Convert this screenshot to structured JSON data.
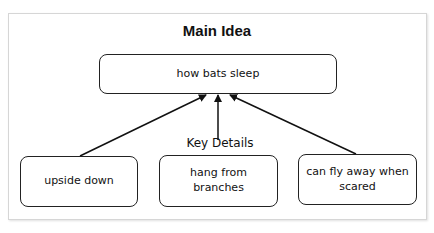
{
  "diagram": {
    "title": "Main Idea",
    "main_idea": "how bats sleep",
    "key_details_label": "Key Details",
    "details": [
      {
        "text": "upside down"
      },
      {
        "text": "hang from branches"
      },
      {
        "text": "can fly away when scared"
      }
    ],
    "colors": {
      "stroke": "#222222",
      "background": "#ffffff",
      "frame_border": "#d6d6d6"
    }
  }
}
